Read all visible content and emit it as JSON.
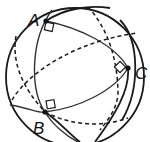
{
  "diagram": {
    "type": "sphere-great-circles",
    "sphere": {
      "cx": 75,
      "cy": 77,
      "r": 69
    },
    "vertices": [
      {
        "id": "A",
        "label": "A",
        "x": 46,
        "y": 21,
        "label_x": 28,
        "label_y": 26
      },
      {
        "id": "B",
        "label": "B",
        "x": 45,
        "y": 112,
        "label_x": 33,
        "label_y": 134
      },
      {
        "id": "C",
        "label": "C",
        "x": 128,
        "y": 68,
        "label_x": 135,
        "label_y": 79
      }
    ],
    "right_angle_marks": [
      "A",
      "B",
      "C"
    ],
    "line_styles": {
      "front": "solid",
      "back": "dashed"
    },
    "colors": {
      "stroke": "#1a1a1a",
      "background": "#ffffff"
    }
  }
}
